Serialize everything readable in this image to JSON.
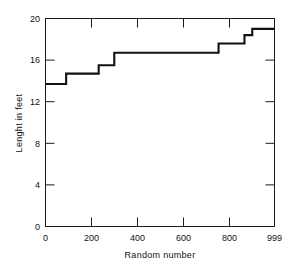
{
  "chart_data": {
    "type": "line",
    "subtype": "step",
    "title": "",
    "xlabel": "Random number",
    "ylabel": "Lenght in feet",
    "xlim": [
      0,
      999
    ],
    "ylim": [
      0,
      20
    ],
    "grid": false,
    "legend": false,
    "x_ticks": [
      0,
      200,
      400,
      600,
      800,
      999
    ],
    "x_tick_labels": [
      "0",
      "200",
      "400",
      "600",
      "800",
      "999"
    ],
    "y_ticks": [
      0,
      4,
      8,
      12,
      16,
      20
    ],
    "y_tick_labels": [
      "0",
      "4",
      "8",
      "12",
      "16",
      "20"
    ],
    "steps": [
      {
        "x_start": 0,
        "x_end": 90,
        "y": 13.7
      },
      {
        "x_start": 90,
        "x_end": 232,
        "y": 14.7
      },
      {
        "x_start": 232,
        "x_end": 300,
        "y": 15.5
      },
      {
        "x_start": 300,
        "x_end": 755,
        "y": 16.7
      },
      {
        "x_start": 755,
        "x_end": 868,
        "y": 17.6
      },
      {
        "x_start": 868,
        "x_end": 902,
        "y": 18.4
      },
      {
        "x_start": 902,
        "x_end": 999,
        "y": 19.0
      }
    ],
    "x": [
      0,
      90,
      90,
      232,
      232,
      300,
      300,
      755,
      755,
      868,
      868,
      902,
      902,
      999
    ],
    "values": [
      13.7,
      13.7,
      14.7,
      14.7,
      15.5,
      15.5,
      16.7,
      16.7,
      17.6,
      17.6,
      18.4,
      18.4,
      19.0,
      19.0
    ],
    "line_color": "#111111",
    "background_color": "#ffffff"
  },
  "axes": {
    "x_title": "Random number",
    "y_title": "Lenght in feet"
  },
  "labels": {
    "y": {
      "t0": "0",
      "t1": "4",
      "t2": "8",
      "t3": "12",
      "t4": "16",
      "t5": "20"
    },
    "x": {
      "t0": "0",
      "t1": "200",
      "t2": "400",
      "t3": "600",
      "t4": "800",
      "t5": "999"
    }
  }
}
